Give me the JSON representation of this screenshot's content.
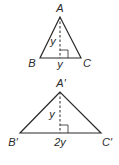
{
  "diagram": {
    "colors": {
      "stroke": "#2a2a2a",
      "background": "#ffffff"
    },
    "triangle1": {
      "vertices": {
        "A": "A",
        "B": "B",
        "C": "C"
      },
      "height_label": "y",
      "base_label": "y"
    },
    "triangle2": {
      "vertices": {
        "A": "A′",
        "B": "B′",
        "C": "C′"
      },
      "height_label": "y",
      "base_label": "2y"
    }
  }
}
